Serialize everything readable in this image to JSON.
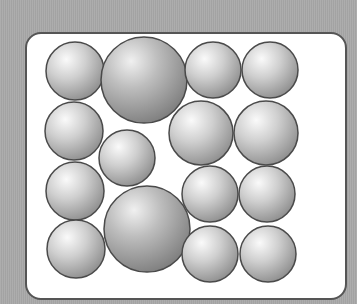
{
  "diagram": {
    "title": "",
    "background_color": "#a9a9a9",
    "panel_color": "#ffffff",
    "sphere_outline": "#4a4a4a",
    "spheres": [
      {
        "cx": 75,
        "cy": 71,
        "r": 29,
        "size": "small"
      },
      {
        "cx": 144,
        "cy": 80,
        "r": 43,
        "size": "large"
      },
      {
        "cx": 213,
        "cy": 70,
        "r": 28,
        "size": "small"
      },
      {
        "cx": 270,
        "cy": 70,
        "r": 28,
        "size": "small"
      },
      {
        "cx": 74,
        "cy": 131,
        "r": 29,
        "size": "small"
      },
      {
        "cx": 127,
        "cy": 158,
        "r": 28,
        "size": "small"
      },
      {
        "cx": 201,
        "cy": 133,
        "r": 32,
        "size": "small"
      },
      {
        "cx": 266,
        "cy": 133,
        "r": 32,
        "size": "small"
      },
      {
        "cx": 75,
        "cy": 191,
        "r": 29,
        "size": "small"
      },
      {
        "cx": 210,
        "cy": 194,
        "r": 28,
        "size": "small"
      },
      {
        "cx": 267,
        "cy": 194,
        "r": 28,
        "size": "small"
      },
      {
        "cx": 147,
        "cy": 229,
        "r": 43,
        "size": "large"
      },
      {
        "cx": 76,
        "cy": 249,
        "r": 29,
        "size": "small"
      },
      {
        "cx": 210,
        "cy": 254,
        "r": 28,
        "size": "small"
      },
      {
        "cx": 268,
        "cy": 254,
        "r": 28,
        "size": "small"
      }
    ]
  }
}
